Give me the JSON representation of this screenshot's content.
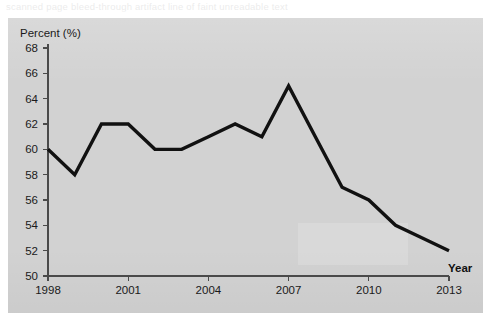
{
  "ghost_text": "scanned page bleed-through artifact line of faint unreadable text",
  "chart_data": {
    "type": "line",
    "title": "",
    "xlabel": "Year",
    "ylabel": "Percent (%)",
    "ylim": [
      50,
      68
    ],
    "xlim": [
      1998,
      2013
    ],
    "ytick_step": 2,
    "xtick_step": 3,
    "grid": false,
    "legend": null,
    "line_color": "#111111",
    "panel_color": "#d2d2d2",
    "yticks": [
      50,
      52,
      54,
      56,
      58,
      60,
      62,
      64,
      66,
      68
    ],
    "xticks": [
      1998,
      2001,
      2004,
      2007,
      2010,
      2013
    ],
    "x": [
      1998,
      1999,
      2000,
      2001,
      2002,
      2003,
      2004,
      2005,
      2006,
      2007,
      2008,
      2009,
      2010,
      2011,
      2012,
      2013
    ],
    "values": [
      60,
      58,
      62,
      62,
      60,
      60,
      61,
      62,
      61,
      65,
      61,
      57,
      56,
      54,
      53,
      52
    ]
  }
}
